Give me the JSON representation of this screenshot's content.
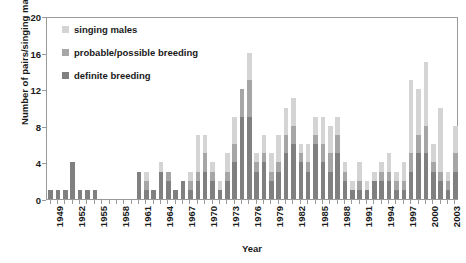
{
  "chart_data": {
    "type": "bar",
    "title": "",
    "subtitle": "",
    "xlabel": "Year",
    "ylabel": "Number of pairs/singing males",
    "ylim": [
      0,
      20
    ],
    "yticks": [
      0,
      4,
      8,
      12,
      16,
      20
    ],
    "grid": false,
    "stacked": true,
    "legend_position": "top-left",
    "x": [
      1949,
      1950,
      1951,
      1952,
      1953,
      1954,
      1955,
      1956,
      1957,
      1958,
      1959,
      1960,
      1961,
      1962,
      1963,
      1964,
      1965,
      1966,
      1967,
      1968,
      1969,
      1970,
      1971,
      1972,
      1973,
      1974,
      1975,
      1976,
      1977,
      1978,
      1979,
      1980,
      1981,
      1982,
      1983,
      1984,
      1985,
      1986,
      1987,
      1988,
      1989,
      1990,
      1991,
      1992,
      1993,
      1994,
      1995,
      1996,
      1997,
      1998,
      1999,
      2000,
      2001,
      2002,
      2003,
      2004
    ],
    "categories": [
      "1949",
      "1950",
      "1951",
      "1952",
      "1953",
      "1954",
      "1955",
      "1956",
      "1957",
      "1958",
      "1959",
      "1960",
      "1961",
      "1962",
      "1963",
      "1964",
      "1965",
      "1966",
      "1967",
      "1968",
      "1969",
      "1970",
      "1971",
      "1972",
      "1973",
      "1974",
      "1975",
      "1976",
      "1977",
      "1978",
      "1979",
      "1980",
      "1981",
      "1982",
      "1983",
      "1984",
      "1985",
      "1986",
      "1987",
      "1988",
      "1989",
      "1990",
      "1991",
      "1992",
      "1993",
      "1994",
      "1995",
      "1996",
      "1997",
      "1998",
      "1999",
      "2000",
      "2001",
      "2002",
      "2003",
      "2004"
    ],
    "series": [
      {
        "name": "definite breeding",
        "color": "#808080",
        "values": [
          1,
          1,
          1,
          4,
          1,
          1,
          1,
          0,
          0,
          0,
          0,
          0,
          3,
          1,
          1,
          3,
          2,
          1,
          2,
          1,
          2,
          3,
          2,
          1,
          2,
          4,
          9,
          9,
          3,
          4,
          2,
          3,
          5,
          6,
          4,
          3,
          6,
          4,
          3,
          5,
          2,
          1,
          1,
          1,
          2,
          2,
          2,
          1,
          1,
          3,
          5,
          5,
          3,
          2,
          1,
          3
        ]
      },
      {
        "name": "probable/possible breeding",
        "color": "#a6a6a6",
        "values": [
          0,
          0,
          0,
          0,
          0,
          0,
          0,
          0,
          0,
          0,
          0,
          0,
          0,
          1,
          0,
          0,
          1,
          0,
          0,
          1,
          1,
          2,
          1,
          0,
          1,
          2,
          3,
          4,
          1,
          1,
          1,
          1,
          2,
          2,
          1,
          1,
          1,
          2,
          2,
          2,
          1,
          0,
          1,
          0,
          0,
          1,
          1,
          1,
          1,
          2,
          2,
          3,
          1,
          1,
          1,
          2
        ]
      },
      {
        "name": "singing males",
        "color": "#d4d4d4",
        "values": [
          0,
          0,
          0,
          0,
          0,
          0,
          0,
          0,
          0,
          0,
          0,
          0,
          0,
          1,
          0,
          1,
          0,
          0,
          0,
          1,
          4,
          2,
          1,
          1,
          2,
          3,
          0,
          3,
          1,
          2,
          2,
          3,
          3,
          3,
          1,
          2,
          2,
          3,
          3,
          2,
          1,
          1,
          2,
          1,
          1,
          1,
          2,
          1,
          2,
          8,
          5,
          7,
          2,
          7,
          1,
          3
        ]
      }
    ],
    "xtick_labels": [
      "1949",
      "1952",
      "1955",
      "1958",
      "1961",
      "1964",
      "1967",
      "1970",
      "1973",
      "1976",
      "1979",
      "1982",
      "1985",
      "1988",
      "1991",
      "1994",
      "1997",
      "2000",
      "2003"
    ]
  },
  "legend": {
    "items": [
      {
        "label": "singing males",
        "color": "#d4d4d4"
      },
      {
        "label": "probable/possible breeding",
        "color": "#a6a6a6"
      },
      {
        "label": "definite breeding",
        "color": "#808080"
      }
    ]
  }
}
